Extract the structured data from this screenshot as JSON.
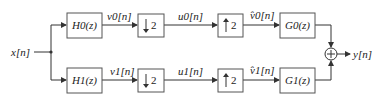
{
  "diagram": {
    "input": "x[n]",
    "output": "y[n]",
    "branches": [
      {
        "analysis_filter": "H0(z)",
        "analysis_out": "v0[n]",
        "down": "2",
        "down_out": "u0[n]",
        "up": "2",
        "up_out": "v̂0[n]",
        "synthesis_filter": "G0(z)"
      },
      {
        "analysis_filter": "H1(z)",
        "analysis_out": "v1[n]",
        "down": "2",
        "down_out": "u1[n]",
        "up": "2",
        "up_out": "v̂1[n]",
        "synthesis_filter": "G1(z)"
      }
    ],
    "summer": "+",
    "colors": {
      "stroke": "#333333",
      "box_border": "#555555",
      "text": "#222222"
    }
  }
}
